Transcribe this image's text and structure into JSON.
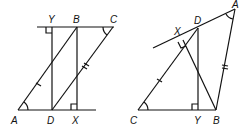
{
  "figures": [
    {
      "name": "parallelogram-figure",
      "labels": {
        "Y": "Y",
        "B": "B",
        "C": "C",
        "A": "A",
        "D": "D",
        "X": "X"
      }
    },
    {
      "name": "triangle-figure",
      "labels": {
        "A": "A",
        "D": "D",
        "X": "X",
        "C": "C",
        "Y": "Y",
        "B": "B"
      }
    }
  ],
  "colors": {
    "stroke": "#111111",
    "background": "#ffffff"
  }
}
